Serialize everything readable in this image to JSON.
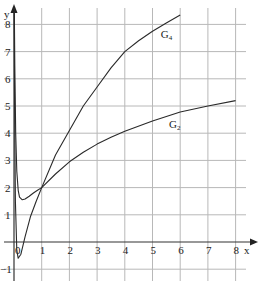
{
  "chart_data": {
    "type": "line",
    "title": "",
    "xlabel": "x",
    "ylabel": "y",
    "xlim": [
      -0.5,
      8.4
    ],
    "ylim": [
      -1.45,
      8.6
    ],
    "grid": true,
    "legend": "inline labels on curves",
    "x_ticks": [
      "0",
      "1",
      "2",
      "3",
      "4",
      "5",
      "6",
      "7",
      "8"
    ],
    "y_ticks": [
      "-1",
      "1",
      "2",
      "3",
      "4",
      "5",
      "6",
      "7",
      "8"
    ],
    "series": [
      {
        "name": "G4",
        "label_main": "G",
        "label_sub": "4",
        "x": [
          0.005,
          0.02,
          0.05,
          0.1,
          0.15,
          0.25,
          0.4,
          0.6,
          0.8,
          1,
          1.5,
          2,
          2.5,
          3,
          3.5,
          4,
          4.5,
          5,
          5.5,
          6
        ],
        "y": [
          8.6,
          5.0,
          1.5,
          -0.3,
          -0.6,
          -0.45,
          0.2,
          0.95,
          1.5,
          2.0,
          3.2,
          4.1,
          5.0,
          5.7,
          6.4,
          7.0,
          7.4,
          7.75,
          8.05,
          8.35
        ]
      },
      {
        "name": "G2",
        "label_main": "G",
        "label_sub": "2",
        "x": [
          0.01,
          0.03,
          0.06,
          0.1,
          0.15,
          0.2,
          0.3,
          0.4,
          0.55,
          0.7,
          0.85,
          1,
          1.5,
          2,
          2.5,
          3,
          3.5,
          4,
          5,
          6,
          7,
          8
        ],
        "y": [
          8.6,
          6.5,
          4.0,
          2.6,
          1.9,
          1.65,
          1.55,
          1.58,
          1.68,
          1.8,
          1.9,
          2.0,
          2.5,
          2.95,
          3.3,
          3.6,
          3.85,
          4.07,
          4.45,
          4.78,
          5.0,
          5.2
        ]
      }
    ],
    "annotations": [
      {
        "text": "G4",
        "x": 5.3,
        "y": 7.5
      },
      {
        "text": "G2",
        "x": 5.6,
        "y": 4.2
      }
    ]
  },
  "axes": {
    "x_label": "x",
    "y_label": "y"
  },
  "colors": {
    "grid": "#b8b8b8",
    "axis": "#333333",
    "curve": "#2a2a2a",
    "background": "#ffffff"
  }
}
